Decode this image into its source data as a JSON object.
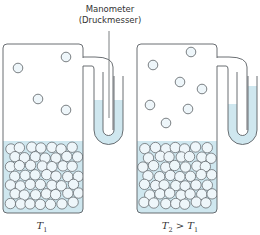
{
  "annotation": {
    "line1": "Manometer",
    "line2": "(Druckmesser)"
  },
  "colors": {
    "outline": "#5a5f63",
    "liquid": "#cfe7ef",
    "particle_fill": "#eef6fa",
    "text": "#333333",
    "background": "#ffffff"
  },
  "containers": [
    {
      "id": "left",
      "label_T": "T",
      "label_sub": "1",
      "label_rest": "",
      "label_x": 42,
      "box": {
        "x": 3,
        "y": 44,
        "w": 80,
        "h": 169
      },
      "liquid_top": 141,
      "gas_particles": [
        [
          18,
          68
        ],
        [
          66,
          57
        ],
        [
          38,
          99
        ],
        [
          66,
          110
        ]
      ],
      "manometer": {
        "x0": 83,
        "left_arm_level": 100,
        "right_arm_level": 100
      }
    },
    {
      "id": "right",
      "label_T": "T",
      "label_sub": "2",
      "label_rest": " > T",
      "label_sub2": "1",
      "label_x": 180,
      "box": {
        "x": 137,
        "y": 44,
        "w": 80,
        "h": 169
      },
      "liquid_top": 141,
      "gas_particles": [
        [
          153,
          65
        ],
        [
          191,
          52
        ],
        [
          180,
          82
        ],
        [
          202,
          89
        ],
        [
          150,
          105
        ],
        [
          188,
          109
        ],
        [
          166,
          123
        ]
      ],
      "manometer": {
        "x0": 217,
        "left_arm_level": 104,
        "right_arm_level": 86
      }
    }
  ]
}
